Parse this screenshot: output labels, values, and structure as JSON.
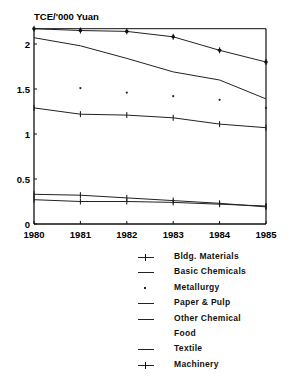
{
  "chart_data": {
    "type": "line",
    "title": "",
    "ylabel": "TCE/'000 Yuan",
    "xlabel": "",
    "x": [
      "1980",
      "1981",
      "1982",
      "1983",
      "1984",
      "1985"
    ],
    "ylim": [
      0,
      2.17
    ],
    "yticks": [
      "0",
      "0.5",
      "1",
      "1.5",
      "2"
    ],
    "grid": false,
    "legend_position": "below-right",
    "series": [
      {
        "name": "Bldg. Materials",
        "marker": "asterisk",
        "values": [
          2.17,
          2.15,
          2.14,
          2.08,
          1.93,
          1.8
        ]
      },
      {
        "name": "Basic Chemicals",
        "marker": "none",
        "values": [
          2.07,
          1.98,
          1.84,
          1.69,
          1.6,
          1.39
        ]
      },
      {
        "name": "Metallurgy",
        "marker": "dot",
        "values": [
          null,
          1.51,
          1.46,
          1.42,
          1.38,
          1.29
        ]
      },
      {
        "name": "Paper & Pulp",
        "marker": "tick",
        "values": [
          1.29,
          1.22,
          1.21,
          1.18,
          1.11,
          1.07
        ]
      },
      {
        "name": "Other Chemical",
        "marker": "none",
        "values": [
          null,
          null,
          null,
          null,
          null,
          null
        ]
      },
      {
        "name": "Food",
        "marker": "none",
        "values": [
          null,
          null,
          null,
          null,
          null,
          null
        ]
      },
      {
        "name": "Textile",
        "marker": "tick",
        "values": [
          0.27,
          0.25,
          0.25,
          0.24,
          0.22,
          0.2
        ]
      },
      {
        "name": "Machinery",
        "marker": "plus",
        "values": [
          0.33,
          0.32,
          0.29,
          0.26,
          0.23,
          0.19
        ]
      }
    ]
  },
  "legend": {
    "items": [
      {
        "label": "Bldg. Materials"
      },
      {
        "label": "Basic Chemicals"
      },
      {
        "label": "Metallurgy"
      },
      {
        "label": "Paper & Pulp"
      },
      {
        "label": "Other Chemical"
      },
      {
        "label": "Food"
      },
      {
        "label": "Textile"
      },
      {
        "label": "Machinery"
      }
    ]
  }
}
